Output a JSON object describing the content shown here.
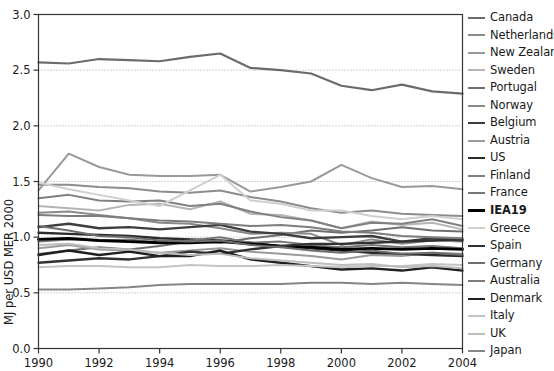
{
  "chart_data": {
    "type": "line",
    "title": "",
    "xlabel": "",
    "ylabel": "MJ per USD MER 2000",
    "xlim": [
      1990,
      2004
    ],
    "ylim": [
      0.0,
      3.0
    ],
    "grid": true,
    "gridlines_y": [
      0.5,
      1.0,
      1.5,
      2.0,
      2.5
    ],
    "legend_position": "right",
    "x": [
      1990,
      1991,
      1992,
      1993,
      1994,
      1995,
      1996,
      1997,
      1998,
      1999,
      2000,
      2001,
      2002,
      2003,
      2004
    ],
    "xticks": [
      "1990",
      "1992",
      "1994",
      "1996",
      "1998",
      "2000",
      "2002",
      "2004"
    ],
    "yticks": [
      "0.0",
      "0.5",
      "1.0",
      "1.5",
      "2.0",
      "2.5",
      "3.0"
    ],
    "series": [
      {
        "name": "Canada",
        "color": "#6b6b6b",
        "width": 2.2,
        "values": [
          2.57,
          2.56,
          2.6,
          2.59,
          2.58,
          2.62,
          2.65,
          2.52,
          2.5,
          2.47,
          2.36,
          2.32,
          2.37,
          2.31,
          2.29
        ]
      },
      {
        "name": "Netherlands",
        "color": "#8c8c8c",
        "width": 2.0,
        "values": [
          1.47,
          1.47,
          1.45,
          1.44,
          1.41,
          1.4,
          1.42,
          1.36,
          1.32,
          1.26,
          1.22,
          1.24,
          1.21,
          1.2,
          1.19
        ]
      },
      {
        "name": "New Zealand",
        "color": "#999999",
        "width": 2.0,
        "values": [
          1.42,
          1.75,
          1.63,
          1.56,
          1.55,
          1.55,
          1.56,
          1.41,
          1.45,
          1.5,
          1.65,
          1.53,
          1.45,
          1.46,
          1.43
        ]
      },
      {
        "name": "Sweden",
        "color": "#b5b5b5",
        "width": 2.0,
        "values": [
          1.28,
          1.26,
          1.24,
          1.29,
          1.3,
          1.25,
          1.32,
          1.21,
          1.2,
          1.15,
          1.08,
          1.14,
          1.11,
          1.13,
          1.07
        ]
      },
      {
        "name": "Portugal",
        "color": "#707070",
        "width": 2.0,
        "values": [
          0.85,
          0.88,
          0.91,
          0.89,
          0.92,
          0.96,
          0.95,
          0.99,
          1.02,
          1.06,
          1.04,
          1.06,
          1.09,
          1.06,
          1.05
        ]
      },
      {
        "name": "Norway",
        "color": "#8a8a8a",
        "width": 2.0,
        "values": [
          1.22,
          1.23,
          1.2,
          1.17,
          1.13,
          1.12,
          1.08,
          1.03,
          1.04,
          1.03,
          0.93,
          0.98,
          0.94,
          0.97,
          0.96
        ]
      },
      {
        "name": "Belgium",
        "color": "#3d3d3d",
        "width": 2.4,
        "values": [
          1.09,
          1.12,
          1.08,
          1.09,
          1.07,
          1.09,
          1.11,
          1.05,
          1.03,
          0.99,
          1.0,
          1.01,
          0.96,
          0.99,
          0.97
        ]
      },
      {
        "name": "Austria",
        "color": "#9b9b9b",
        "width": 2.0,
        "values": [
          0.9,
          0.93,
          0.89,
          0.88,
          0.86,
          0.88,
          0.9,
          0.87,
          0.85,
          0.83,
          0.8,
          0.84,
          0.83,
          0.86,
          0.85
        ]
      },
      {
        "name": "US",
        "color": "#2b2b2b",
        "width": 2.4,
        "values": [
          1.04,
          1.03,
          1.02,
          1.01,
          0.99,
          0.98,
          0.97,
          0.95,
          0.92,
          0.9,
          0.88,
          0.86,
          0.85,
          0.84,
          0.83
        ]
      },
      {
        "name": "Finland",
        "color": "#808080",
        "width": 2.0,
        "values": [
          1.35,
          1.38,
          1.33,
          1.32,
          1.33,
          1.28,
          1.3,
          1.23,
          1.18,
          1.15,
          1.08,
          1.13,
          1.12,
          1.16,
          1.1
        ]
      },
      {
        "name": "France",
        "color": "#767676",
        "width": 2.0,
        "values": [
          0.96,
          0.98,
          0.97,
          0.98,
          0.95,
          0.97,
          1.0,
          0.95,
          0.96,
          0.93,
          0.91,
          0.93,
          0.91,
          0.92,
          0.9
        ]
      },
      {
        "name": "IEA19",
        "color": "#000000",
        "width": 2.8,
        "values": [
          0.98,
          0.99,
          0.97,
          0.96,
          0.95,
          0.95,
          0.96,
          0.94,
          0.92,
          0.91,
          0.89,
          0.9,
          0.89,
          0.9,
          0.89
        ]
      },
      {
        "name": "Greece",
        "color": "#cfcfcf",
        "width": 2.0,
        "values": [
          1.49,
          1.43,
          1.38,
          1.33,
          1.28,
          1.42,
          1.56,
          1.33,
          1.3,
          1.24,
          1.24,
          1.19,
          1.16,
          1.19,
          1.16
        ]
      },
      {
        "name": "Spain",
        "color": "#313131",
        "width": 2.4,
        "values": [
          0.77,
          0.79,
          0.81,
          0.8,
          0.83,
          0.87,
          0.85,
          0.89,
          0.92,
          0.94,
          0.94,
          0.95,
          0.96,
          0.97,
          0.98
        ]
      },
      {
        "name": "Germany",
        "color": "#6e6e6e",
        "width": 2.0,
        "values": [
          1.1,
          1.06,
          1.01,
          1.0,
          0.97,
          0.96,
          0.97,
          0.93,
          0.91,
          0.88,
          0.86,
          0.88,
          0.85,
          0.86,
          0.84
        ]
      },
      {
        "name": "Australia",
        "color": "#7d7d7d",
        "width": 2.0,
        "values": [
          1.2,
          1.19,
          1.19,
          1.17,
          1.15,
          1.14,
          1.12,
          1.1,
          1.11,
          1.09,
          1.05,
          1.04,
          1.01,
          1.0,
          0.99
        ]
      },
      {
        "name": "Denmark",
        "color": "#1f1f1f",
        "width": 2.4,
        "values": [
          0.84,
          0.88,
          0.84,
          0.87,
          0.83,
          0.83,
          0.88,
          0.8,
          0.77,
          0.74,
          0.71,
          0.72,
          0.7,
          0.73,
          0.7
        ]
      },
      {
        "name": "Italy",
        "color": "#c4c4c4",
        "width": 2.0,
        "values": [
          0.73,
          0.74,
          0.74,
          0.73,
          0.73,
          0.75,
          0.74,
          0.74,
          0.75,
          0.74,
          0.73,
          0.74,
          0.74,
          0.76,
          0.75
        ]
      },
      {
        "name": "UK",
        "color": "#bdbdbd",
        "width": 2.0,
        "values": [
          0.93,
          0.94,
          0.9,
          0.89,
          0.86,
          0.84,
          0.85,
          0.81,
          0.79,
          0.77,
          0.75,
          0.76,
          0.73,
          0.74,
          0.72
        ]
      },
      {
        "name": "Japan",
        "color": "#858585",
        "width": 2.0,
        "values": [
          0.53,
          0.53,
          0.54,
          0.55,
          0.57,
          0.58,
          0.58,
          0.58,
          0.58,
          0.59,
          0.59,
          0.58,
          0.59,
          0.58,
          0.57
        ]
      }
    ]
  },
  "axes": {
    "y_title": "MJ per USD MER 2000",
    "y_tick_labels": [
      "3.0",
      "2.5",
      "2.0",
      "1.5",
      "1.0",
      "0.5",
      "0.0"
    ],
    "x_tick_labels": [
      "1990",
      "1992",
      "1994",
      "1996",
      "1998",
      "2000",
      "2002",
      "2004"
    ]
  },
  "legend": {
    "items": [
      {
        "label": "Canada",
        "color": "#6b6b6b",
        "width": 2.2,
        "bold": false
      },
      {
        "label": "Netherlands",
        "color": "#8c8c8c",
        "width": 2.0,
        "bold": false
      },
      {
        "label": "New Zealand",
        "color": "#999999",
        "width": 2.0,
        "bold": false
      },
      {
        "label": "Sweden",
        "color": "#b5b5b5",
        "width": 2.0,
        "bold": false
      },
      {
        "label": "Portugal",
        "color": "#707070",
        "width": 2.0,
        "bold": false
      },
      {
        "label": "Norway",
        "color": "#8a8a8a",
        "width": 2.0,
        "bold": false
      },
      {
        "label": "Belgium",
        "color": "#3d3d3d",
        "width": 2.6,
        "bold": false
      },
      {
        "label": "Austria",
        "color": "#9b9b9b",
        "width": 2.0,
        "bold": false
      },
      {
        "label": "US",
        "color": "#2b2b2b",
        "width": 2.6,
        "bold": false
      },
      {
        "label": "Finland",
        "color": "#808080",
        "width": 2.0,
        "bold": false
      },
      {
        "label": "France",
        "color": "#767676",
        "width": 2.0,
        "bold": false
      },
      {
        "label": "IEA19",
        "color": "#000000",
        "width": 3.0,
        "bold": true
      },
      {
        "label": "Greece",
        "color": "#cfcfcf",
        "width": 2.0,
        "bold": false
      },
      {
        "label": "Spain",
        "color": "#313131",
        "width": 2.6,
        "bold": false
      },
      {
        "label": "Germany",
        "color": "#6e6e6e",
        "width": 2.0,
        "bold": false
      },
      {
        "label": "Australia",
        "color": "#7d7d7d",
        "width": 2.0,
        "bold": false
      },
      {
        "label": "Denmark",
        "color": "#1f1f1f",
        "width": 2.6,
        "bold": false
      },
      {
        "label": "Italy",
        "color": "#c4c4c4",
        "width": 2.0,
        "bold": false
      },
      {
        "label": "UK",
        "color": "#bdbdbd",
        "width": 2.0,
        "bold": false
      },
      {
        "label": "Japan",
        "color": "#858585",
        "width": 2.0,
        "bold": false
      }
    ]
  },
  "colors": {
    "axis": "#333333",
    "grid": "#9a9a9a",
    "background": "#ffffff",
    "text": "#1a1a1a"
  }
}
